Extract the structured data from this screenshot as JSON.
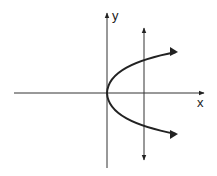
{
  "diagram": {
    "labels": {
      "x_axis": "x",
      "y_axis": "y"
    },
    "curve": {
      "type": "parabola",
      "equation_shape": "x = y^2 (opens right)"
    },
    "test_line": {
      "type": "vertical line",
      "intersections": 2
    },
    "colors": {
      "stroke": "#222222",
      "background": "#ffffff"
    }
  }
}
